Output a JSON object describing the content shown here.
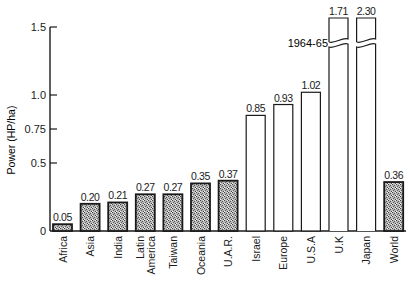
{
  "chart_data": {
    "type": "bar",
    "title": "",
    "xlabel": "",
    "ylabel": "Power (HP/ha)",
    "ylim": [
      0,
      1.5
    ],
    "yticks": [
      {
        "value": 0,
        "label": "0"
      },
      {
        "value": 0.5,
        "label": "0.5"
      },
      {
        "value": 0.75,
        "label": "0.75"
      },
      {
        "value": 1.0,
        "label": "1.0"
      },
      {
        "value": 1.5,
        "label": "1.5"
      }
    ],
    "grid": false,
    "legend": null,
    "categories": [
      "Africa",
      "Asia",
      "India",
      "Latin America",
      "Taiwan",
      "Oceania",
      "U.A.R.",
      "Israel",
      "Europe",
      "U.S.A",
      "U.K",
      "Japan",
      "World"
    ],
    "category_lines": [
      [
        "Africa"
      ],
      [
        "Asia"
      ],
      [
        "India"
      ],
      [
        "Latin",
        "America"
      ],
      [
        "Taiwan"
      ],
      [
        "Oceania"
      ],
      [
        "U.A.R."
      ],
      [
        "Israel"
      ],
      [
        "Europe"
      ],
      [
        "U.S.A"
      ],
      [
        "U.K"
      ],
      [
        "Japan"
      ],
      [
        "World"
      ]
    ],
    "values": [
      0.05,
      0.2,
      0.21,
      0.27,
      0.27,
      0.35,
      0.37,
      0.85,
      0.93,
      1.02,
      1.71,
      2.3,
      0.36
    ],
    "value_labels": [
      "0.05",
      "0.20",
      "0.21",
      "0.27",
      "0.27",
      "0.35",
      "0.37",
      "0.85",
      "0.93",
      "1.02",
      "1.71",
      "2.30",
      "0.36"
    ],
    "fill": [
      "stippled",
      "stippled",
      "stippled",
      "stippled",
      "stippled",
      "stippled",
      "stippled",
      "open",
      "open",
      "open",
      "open",
      "open",
      "stippled"
    ],
    "broken_bars": [
      "U.K",
      "Japan"
    ],
    "annotations": [
      {
        "text": "1964-65",
        "target": "axis break on U.K and Japan bars"
      }
    ]
  },
  "colors": {
    "ink": "#1a1a1a",
    "stipple_base": "#bdbdbd",
    "stipple_dark": "#4a4a4a",
    "background": "#ffffff"
  }
}
